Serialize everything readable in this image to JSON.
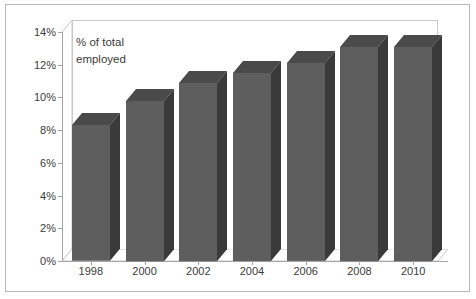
{
  "chart_data": {
    "type": "bar",
    "title": "",
    "subtitle": "",
    "xlabel": "",
    "ylabel": "",
    "annotation": "% of total\nemployed",
    "categories": [
      "1998",
      "2000",
      "2002",
      "2004",
      "2006",
      "2008",
      "2010"
    ],
    "values": [
      8.3,
      9.8,
      10.9,
      11.5,
      12.1,
      13.1,
      13.1
    ],
    "ylim": [
      0,
      14
    ],
    "ytick_labels": [
      "0%",
      "2%",
      "4%",
      "6%",
      "8%",
      "10%",
      "12%",
      "14%"
    ],
    "ytick_values": [
      0,
      2,
      4,
      6,
      8,
      10,
      12,
      14
    ],
    "grid": false,
    "legend": "none",
    "style": "3d-column",
    "series": [
      {
        "name": "% of total employed",
        "values": [
          8.3,
          9.8,
          10.9,
          11.5,
          12.1,
          13.1,
          13.1
        ]
      }
    ],
    "colors": {
      "bar_front": "#5e5e5e",
      "bar_side": "#3a3a3a",
      "bar_top": "#4a4a4a",
      "axis": "#a6a6a6",
      "text": "#3b3b3b",
      "frame": "#b9b9b9",
      "wall": "#ffffff"
    }
  }
}
